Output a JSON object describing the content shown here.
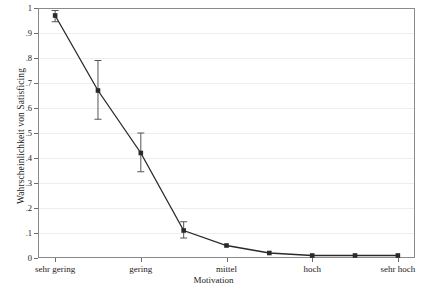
{
  "chart_data": {
    "type": "line",
    "title": "",
    "xlabel": "Motivation",
    "ylabel": "Wahrscheinlichkeit von Satisficing",
    "ylim": [
      0,
      1
    ],
    "ytick_values": [
      0,
      0.1,
      0.2,
      0.3,
      0.4,
      0.5,
      0.6,
      0.7,
      0.8,
      0.9,
      1
    ],
    "ytick_labels": [
      "0",
      ".1",
      ".2",
      ".3",
      ".4",
      ".5",
      ".6",
      ".7",
      ".8",
      ".9",
      "1"
    ],
    "xtick_labels": [
      "sehr gering",
      "gering",
      "mittel",
      "hoch",
      "sehr hoch"
    ],
    "xtick_positions": [
      1,
      3,
      5,
      7,
      9
    ],
    "xlim": [
      0.6,
      9.4
    ],
    "grid": true,
    "legend": null,
    "series": [
      {
        "name": "Wahrscheinlichkeit von Satisficing",
        "x": [
          1,
          2,
          3,
          4,
          5,
          6,
          7,
          8,
          9
        ],
        "values": [
          0.97,
          0.67,
          0.42,
          0.11,
          0.05,
          0.02,
          0.01,
          0.01,
          0.01
        ],
        "errors_low": [
          0.945,
          0.555,
          0.345,
          0.08,
          null,
          null,
          null,
          null,
          null
        ],
        "errors_high": [
          0.99,
          0.79,
          0.5,
          0.145,
          null,
          null,
          null,
          null,
          null
        ],
        "marker": "square",
        "color": "#2a2a2a"
      }
    ]
  },
  "axes": {
    "y_title": "Wahrscheinlichkeit von Satisficing",
    "x_title": "Motivation"
  }
}
